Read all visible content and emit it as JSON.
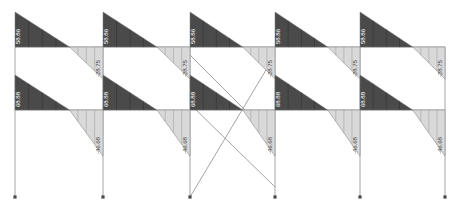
{
  "figure": {
    "kind": "bending-moment-diagram",
    "title": "",
    "frame": {
      "bays": 5,
      "stories": 2,
      "columns": 6,
      "support_type": "pinned"
    },
    "colors": {
      "negative_fill": "#4a4a4a",
      "positive_fill": "#d9d9d9",
      "member_line": "#9a9a9a",
      "outline": "#7a7a7a",
      "background": "#ffffff",
      "label_on_dark": "#ffffff",
      "label_on_light": "#4a4a4a"
    },
    "geometry": {
      "column_x": [
        15,
        103,
        190,
        275,
        360,
        445
      ],
      "beam_y": [
        47,
        110
      ],
      "base_y": 197,
      "roof_top_y": 12,
      "story_top_y": 75
    }
  },
  "chart_data": {
    "type": "bar",
    "xlabel": "",
    "ylabel": "Bending moment",
    "categories": [
      "Level 2 Bay 1",
      "Level 2 Bay 2",
      "Level 2 Bay 3",
      "Level 2 Bay 4",
      "Level 2 Bay 5",
      "Level 1 Bay 1",
      "Level 1 Bay 2",
      "Level 1 Bay 3",
      "Level 1 Bay 4",
      "Level 1 Bay 5"
    ],
    "series": [
      {
        "name": "Left end moment",
        "values": [
          58.86,
          58.86,
          58.86,
          58.86,
          58.86,
          68.88,
          68.88,
          68.88,
          68.88,
          68.88
        ]
      },
      {
        "name": "Right end moment",
        "values": [
          -28.75,
          -28.75,
          -28.75,
          -28.75,
          -28.75,
          -46.68,
          -46.68,
          -46.68,
          -46.68,
          -46.68
        ]
      }
    ],
    "grid": false,
    "legend": "none"
  },
  "levels": [
    {
      "name": "upper-beam-level",
      "y": 47,
      "bays": [
        {
          "name": "bay-1",
          "x0": 15,
          "x1": 103,
          "neg": "58.86",
          "pos": "-28.75"
        },
        {
          "name": "bay-2",
          "x0": 103,
          "x1": 190,
          "neg": "58.86",
          "pos": "-28.75"
        },
        {
          "name": "bay-3",
          "x0": 190,
          "x1": 275,
          "neg": "58.86",
          "pos": "-28.75"
        },
        {
          "name": "bay-4",
          "x0": 275,
          "x1": 360,
          "neg": "58.86",
          "pos": "-28.75"
        },
        {
          "name": "bay-5",
          "x0": 360,
          "x1": 445,
          "neg": "58.86",
          "pos": "-28.75"
        }
      ]
    },
    {
      "name": "lower-beam-level",
      "y": 110,
      "bays": [
        {
          "name": "bay-1",
          "x0": 15,
          "x1": 103,
          "neg": "68.88",
          "pos": "-46.68"
        },
        {
          "name": "bay-2",
          "x0": 103,
          "x1": 190,
          "neg": "68.88",
          "pos": "-46.68"
        },
        {
          "name": "bay-3",
          "x0": 190,
          "x1": 275,
          "neg": "68.88",
          "pos": "-46.68"
        },
        {
          "name": "bay-4",
          "x0": 275,
          "x1": 360,
          "neg": "68.88",
          "pos": "-46.68"
        },
        {
          "name": "bay-5",
          "x0": 360,
          "x1": 445,
          "neg": "68.88",
          "pos": "-46.68"
        }
      ]
    }
  ],
  "bracing": {
    "name": "center-bay-x-bracing",
    "present": true,
    "bay_index": 3
  }
}
